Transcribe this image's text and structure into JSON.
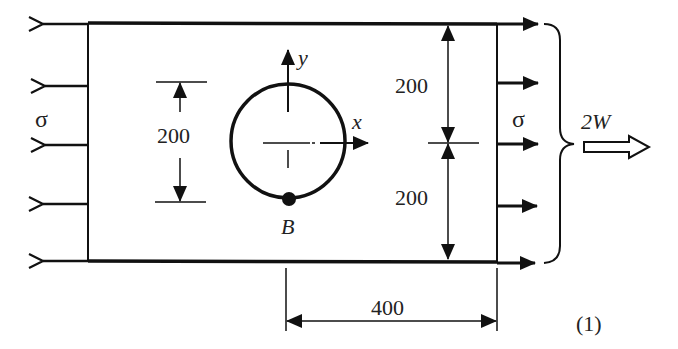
{
  "figure": {
    "label": "(1)",
    "plate": {
      "width_dim": "400",
      "half_height_top": "200",
      "half_height_bottom": "200"
    },
    "hole": {
      "diameter_dim": "200",
      "point_label": "B"
    },
    "axes": {
      "x_label": "x",
      "y_label": "y"
    },
    "loads": {
      "left_stress": "σ",
      "right_stress": "σ",
      "resultant": "2W"
    }
  },
  "colors": {
    "stroke": "#111111",
    "background": "#ffffff"
  }
}
